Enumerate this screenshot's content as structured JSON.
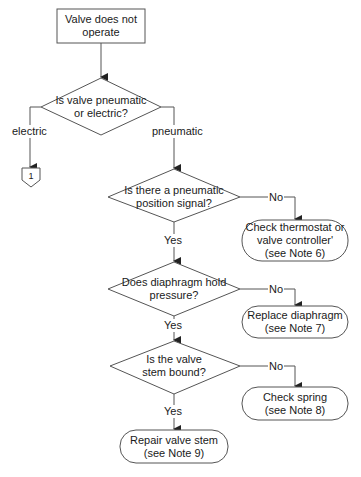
{
  "diagram": {
    "type": "flowchart",
    "colors": {
      "stroke": "#555555",
      "background": "#ffffff",
      "text": "#1a1a1a"
    },
    "start": {
      "lines": [
        "Valve does not",
        "operate"
      ]
    },
    "decisions": [
      {
        "id": "d1",
        "lines": [
          "Is valve pneumatic",
          "or electric?"
        ],
        "left_label": "electric",
        "right_label": "pneumatic"
      },
      {
        "id": "d2",
        "lines": [
          "Is there a pneumatic",
          "position signal?"
        ],
        "yes_label": "Yes",
        "no_label": "No"
      },
      {
        "id": "d3",
        "lines": [
          "Does diaphragm hold",
          "pressure?"
        ],
        "yes_label": "Yes",
        "no_label": "No"
      },
      {
        "id": "d4",
        "lines": [
          "Is the valve",
          "stem bound?"
        ],
        "yes_label": "Yes",
        "no_label": "No"
      }
    ],
    "terminals": [
      {
        "id": "t1",
        "lines": [
          "Check thermostat or",
          "valve controller'",
          "(see Note 6)"
        ]
      },
      {
        "id": "t2",
        "lines": [
          "Replace diaphragm",
          "(see Note 7)"
        ]
      },
      {
        "id": "t3",
        "lines": [
          "Check spring",
          "(see Note 8)"
        ]
      },
      {
        "id": "t4",
        "lines": [
          "Repair valve stem",
          "(see Note 9)"
        ]
      }
    ],
    "offpage_connector": {
      "label": "1"
    }
  }
}
